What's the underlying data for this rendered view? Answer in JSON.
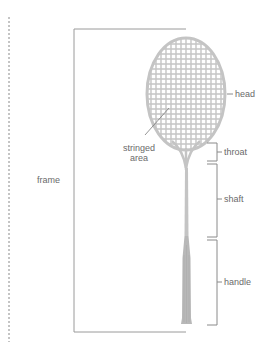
{
  "diagram": {
    "labels": {
      "head": "head",
      "stringed_area_line1": "stringed",
      "stringed_area_line2": "area",
      "throat": "throat",
      "shaft": "shaft",
      "handle": "handle",
      "frame": "frame"
    },
    "colors": {
      "racquet": "#c4c4c4",
      "handle": "#b8b8b8",
      "lines": "#8a8a8a",
      "text": "#6a6a6a",
      "dashed": "#8a8a8a"
    }
  }
}
